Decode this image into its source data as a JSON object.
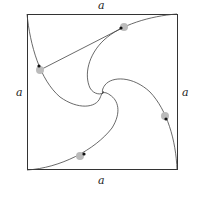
{
  "diagram": {
    "side_labels": {
      "top": "a",
      "left": "a",
      "right": "a",
      "bottom": "a"
    },
    "square": {
      "x": 27,
      "y": 14,
      "width": 150,
      "height": 156
    },
    "bugs": [
      {
        "name": "top",
        "x": 124,
        "y": 27
      },
      {
        "name": "left",
        "x": 40,
        "y": 70
      },
      {
        "name": "right",
        "x": 165,
        "y": 116
      },
      {
        "name": "bottom",
        "x": 80,
        "y": 156
      }
    ],
    "colors": {
      "line": "#333333",
      "bug": "#999999"
    }
  }
}
